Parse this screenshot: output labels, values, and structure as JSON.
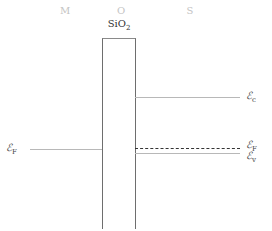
{
  "header": {
    "regions": [
      {
        "label": "M",
        "x": 65
      },
      {
        "label": "O",
        "x": 121
      },
      {
        "label": "S",
        "x": 190
      }
    ]
  },
  "oxide": {
    "label": "SiO",
    "subscript": "2"
  },
  "levels": {
    "ec": {
      "symbol": "ℰ",
      "sub": "c"
    },
    "ef_metal": {
      "symbol": "ℰ",
      "sub": "F"
    },
    "ef_semi": {
      "symbol": "ℰ",
      "sub": "F"
    },
    "ev": {
      "symbol": "ℰ",
      "sub": "v"
    }
  }
}
